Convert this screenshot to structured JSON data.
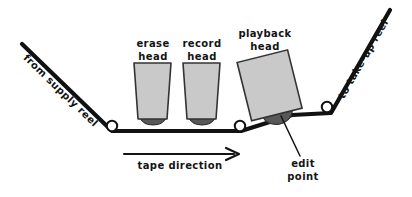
{
  "diagram": {
    "colors": {
      "tape_line": "#111111",
      "head_fill": "#c9c9c9",
      "head_stroke": "#333333",
      "head_gap_fill": "#585858",
      "roller_fill": "#ffffff",
      "roller_stroke": "#111111",
      "text": "#141414",
      "background": "#ffffff"
    },
    "labels": {
      "from_supply_reel": "from supply reel",
      "to_takeup_reel": "to take-up reel",
      "tape_direction": "tape direction",
      "edit_point_line1": "edit",
      "edit_point_line2": "point"
    },
    "heads": [
      {
        "id": "erase-head",
        "line1": "erase",
        "line2": "head"
      },
      {
        "id": "record-head",
        "line1": "record",
        "line2": "head"
      },
      {
        "id": "playback-head",
        "line1": "playback",
        "line2": "head"
      }
    ]
  }
}
